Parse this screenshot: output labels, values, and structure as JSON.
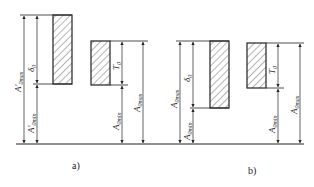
{
  "figure": {
    "panels": [
      {
        "caption": "a)",
        "labels": {
          "outer_total": "A'",
          "outer_total_sub": "0max",
          "outer_min": "A'",
          "outer_min_sub": "0min",
          "outer_tol": "δ",
          "outer_tol_sub": "0",
          "inner_tol": "T",
          "inner_tol_sub": "0",
          "inner_min": "A",
          "inner_min_sub": "0min",
          "inner_max": "A",
          "inner_max_sub": "0max"
        }
      },
      {
        "caption": "b)",
        "labels": {
          "outer_total": "A",
          "outer_total_sub": "0max",
          "outer_min": "A",
          "outer_min_sub": "0min",
          "outer_tol": "δ",
          "outer_tol_sub": "0",
          "inner_tol": "T",
          "inner_tol_sub": "0",
          "inner_min": "A",
          "inner_min_sub": "0min",
          "inner_max": "A",
          "inner_max_sub": "0max"
        }
      }
    ],
    "colors": {
      "line": "#222222",
      "hatch": "#444444",
      "background": "#ffffff"
    }
  }
}
